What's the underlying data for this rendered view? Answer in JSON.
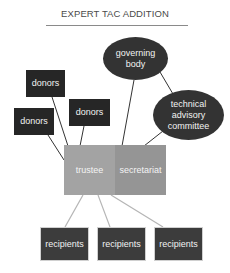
{
  "title": "EXPERT TAC ADDITION",
  "nodes": {
    "governing_body": {
      "label": "governing body",
      "color": "#333333",
      "shape": "ellipse"
    },
    "technical_advisory_committee": {
      "label": "technical advisory committee",
      "color": "#333333",
      "shape": "ellipse"
    },
    "donors_top": {
      "label": "donors",
      "color": "#262626"
    },
    "donors_left": {
      "label": "donors",
      "color": "#262626"
    },
    "donors_middle": {
      "label": "donors",
      "color": "#262626"
    },
    "trustee": {
      "label": "trustee",
      "color": "#a3a3a3"
    },
    "secretariat": {
      "label": "secretariat",
      "color": "#959595"
    },
    "recipients_1": {
      "label": "recipients",
      "color": "#3c3c3c"
    },
    "recipients_2": {
      "label": "recipients",
      "color": "#3c3c3c"
    },
    "recipients_3": {
      "label": "recipients",
      "color": "#3c3c3c"
    }
  },
  "edges": [
    {
      "from": "donors_top",
      "to": "trustee"
    },
    {
      "from": "donors_left",
      "to": "trustee"
    },
    {
      "from": "donors_middle",
      "to": "trustee"
    },
    {
      "from": "governing_body",
      "to": "secretariat"
    },
    {
      "from": "governing_body",
      "to": "technical_advisory_committee"
    },
    {
      "from": "technical_advisory_committee",
      "to": "secretariat"
    },
    {
      "from": "trustee",
      "to": "recipients_1"
    },
    {
      "from": "trustee",
      "to": "recipients_2"
    },
    {
      "from": "trustee",
      "to": "recipients_3"
    }
  ],
  "colors": {
    "dark_edge": "#333333",
    "light_edge": "#b5b5b5"
  }
}
